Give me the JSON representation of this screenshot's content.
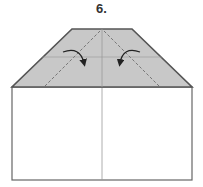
{
  "diagram": {
    "step_label": "6.",
    "colors": {
      "flap_fill": "#c8c8c8",
      "outline": "#555555",
      "paper": "#ffffff",
      "crease": "#888888",
      "arrow": "#222222"
    },
    "shapes": {
      "flap": "trapezoid",
      "body": "rectangle",
      "fold_lines": "two dashed diagonals",
      "arrows": "two curved fold arrows"
    }
  }
}
